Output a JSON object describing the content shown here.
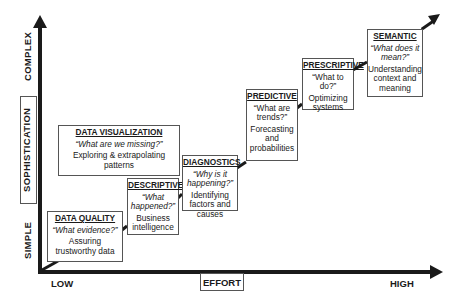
{
  "diagram": {
    "type": "staircase-maturity-model",
    "y_axis": {
      "label": "SOPHISTICATION",
      "top_label": "COMPLEX",
      "bottom_label": "SIMPLE"
    },
    "x_axis": {
      "label": "EFFORT",
      "left_label": "LOW",
      "right_label": "HIGH"
    },
    "stages": [
      {
        "title": "DATA QUALITY",
        "question": "“What evidence?”",
        "description": "Assuring trustworthy data"
      },
      {
        "title": "DESCRIPTIVE",
        "question": "“What happened?”",
        "description": "Business intelligence"
      },
      {
        "title": "DIAGNOSTICS",
        "question": "“Why is it happening?”",
        "description": "Identifying factors and causes"
      },
      {
        "title": "PREDICTIVE",
        "question": "“What are trends?”",
        "description": "Forecasting and probabilities"
      },
      {
        "title": "PRESCRIPTIVE",
        "question": "“What to do?”",
        "description": "Optimizing systems"
      },
      {
        "title": "SEMANTIC",
        "question": "“What does it mean?”",
        "description": "Understanding context and meaning"
      }
    ],
    "side_stage": {
      "title": "DATA VISUALIZATION",
      "question": "“What are we missing?”",
      "description": "Exploring & extrapolating patterns"
    },
    "colors": {
      "line": "#1a1a1a",
      "box_border": "#555555",
      "background": "#ffffff"
    }
  }
}
